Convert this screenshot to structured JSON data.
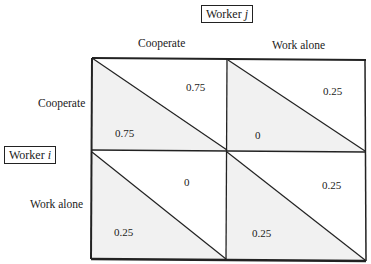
{
  "players": {
    "column": {
      "label": "Worker",
      "index": "j"
    },
    "row": {
      "label": "Worker",
      "index": "i"
    }
  },
  "strategies": {
    "column": [
      "Cooperate",
      "Work alone"
    ],
    "row": [
      "Cooperate",
      "Work alone"
    ]
  },
  "payoffs": [
    {
      "row": "Cooperate",
      "col": "Cooperate",
      "worker_i": "0.75",
      "worker_j": "0.75"
    },
    {
      "row": "Cooperate",
      "col": "Work alone",
      "worker_i": "0",
      "worker_j": "0.25"
    },
    {
      "row": "Work alone",
      "col": "Cooperate",
      "worker_i": "0.25",
      "worker_j": "0"
    },
    {
      "row": "Work alone",
      "col": "Work alone",
      "worker_i": "0.25",
      "worker_j": "0.25"
    }
  ],
  "colors": {
    "line": "#222222",
    "shade": "#f1f1f1",
    "background": "#ffffff"
  }
}
